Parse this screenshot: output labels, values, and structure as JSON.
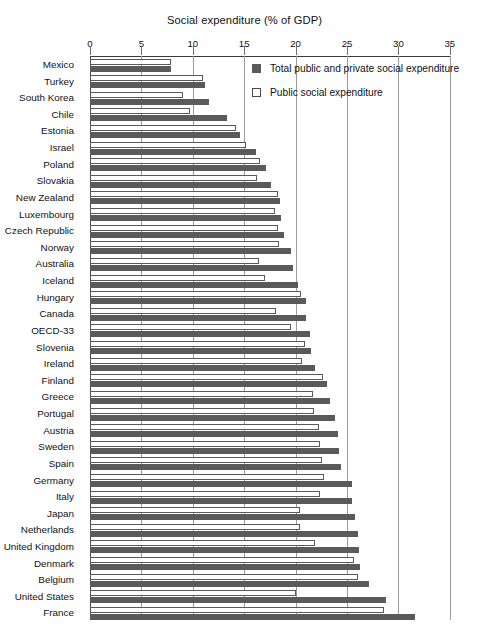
{
  "chart_data": {
    "type": "bar",
    "orientation": "horizontal",
    "title": "Social expenditure (% of GDP)",
    "xlabel": "",
    "ylabel": "",
    "xlim": [
      0,
      35
    ],
    "xticks": [
      0,
      5,
      10,
      15,
      20,
      25,
      30,
      35
    ],
    "xtick_labels": [
      "0",
      "5",
      "10",
      "15",
      "20",
      "25",
      "30",
      "35"
    ],
    "grid": true,
    "legend_position": "top-right",
    "categories": [
      "Mexico",
      "Turkey",
      "South Korea",
      "Chile",
      "Estonia",
      "Israel",
      "Poland",
      "Slovakia",
      "New Zealand",
      "Luxembourg",
      "Czech Republic",
      "Norway",
      "Australia",
      "Iceland",
      "Hungary",
      "Canada",
      "OECD-33",
      "Slovenia",
      "Ireland",
      "Finland",
      "Greece",
      "Portugal",
      "Austria",
      "Sweden",
      "Spain",
      "Germany",
      "Italy",
      "Japan",
      "Netherlands",
      "United Kingdom",
      "Denmark",
      "Belgium",
      "United States",
      "France"
    ],
    "series": [
      {
        "name": "Public social expenditure",
        "key": "public",
        "color": "#ffffff",
        "edge_color": "#595959",
        "values": [
          7.9,
          11.0,
          9.0,
          9.7,
          14.2,
          15.2,
          16.5,
          16.2,
          18.3,
          18.0,
          18.3,
          18.4,
          16.4,
          17.0,
          20.5,
          18.1,
          19.6,
          20.9,
          20.6,
          22.7,
          21.7,
          21.8,
          22.3,
          22.4,
          22.6,
          22.8,
          22.4,
          20.4,
          20.4,
          21.9,
          25.7,
          26.1,
          20.0,
          28.6
        ]
      },
      {
        "name": "Total public and private social expenditure",
        "key": "total",
        "color": "#5a5a5a",
        "values": [
          7.9,
          11.2,
          11.6,
          13.3,
          14.6,
          16.1,
          17.1,
          17.6,
          18.5,
          18.6,
          18.9,
          19.6,
          19.7,
          20.2,
          21.0,
          21.0,
          21.4,
          21.5,
          21.9,
          23.1,
          23.3,
          23.8,
          24.1,
          24.2,
          24.4,
          25.5,
          25.5,
          25.8,
          26.1,
          26.2,
          26.3,
          27.1,
          28.8,
          31.6
        ]
      }
    ],
    "legend": [
      "Total public and private social expenditure",
      "Public social expenditure"
    ]
  },
  "axis": {
    "unit_px_per_value": 10.28,
    "origin_px": 90
  }
}
